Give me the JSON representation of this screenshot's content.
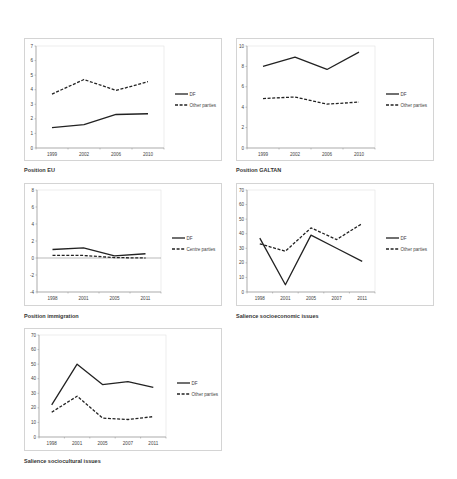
{
  "chart_data": [
    {
      "id": "eu",
      "type": "line",
      "title": "Position EU",
      "categories": [
        "1999",
        "2002",
        "2006",
        "2010"
      ],
      "series": [
        {
          "name": "DF",
          "style": "solid",
          "values": [
            1.4,
            1.6,
            2.3,
            2.35
          ]
        },
        {
          "name": "Other parties",
          "style": "dashed",
          "values": [
            3.7,
            4.7,
            3.95,
            4.55
          ]
        }
      ],
      "ylim": [
        0,
        7
      ],
      "ystep": 1,
      "yticks": [
        "0",
        "1",
        "2",
        "3",
        "4",
        "5",
        "6",
        "7"
      ],
      "xlabel": "",
      "ylabel": "",
      "grid": false,
      "legend_position": "right",
      "box": {
        "x": 24,
        "y": 38,
        "w": 198,
        "h": 123
      },
      "plot": {
        "x": 11,
        "y": 7,
        "w": 128,
        "h": 102
      }
    },
    {
      "id": "galtan",
      "type": "line",
      "title": "Position GALTAN",
      "categories": [
        "1999",
        "2002",
        "2006",
        "2010"
      ],
      "series": [
        {
          "name": "DF",
          "style": "solid",
          "values": [
            8.0,
            8.9,
            7.7,
            9.4
          ]
        },
        {
          "name": "Other parties",
          "style": "dashed",
          "values": [
            4.85,
            5.0,
            4.3,
            4.5
          ]
        }
      ],
      "ylim": [
        0,
        10
      ],
      "ystep": 2,
      "yticks": [
        "0",
        "2",
        "4",
        "6",
        "8",
        "10"
      ],
      "xlabel": "",
      "ylabel": "",
      "grid": false,
      "legend_position": "right",
      "box": {
        "x": 236,
        "y": 38,
        "w": 198,
        "h": 123
      },
      "plot": {
        "x": 10,
        "y": 7,
        "w": 128,
        "h": 102
      }
    },
    {
      "id": "immigration",
      "type": "line",
      "title": "Position immigration",
      "categories": [
        "1998",
        "2001",
        "2005",
        "2011"
      ],
      "series": [
        {
          "name": "DF",
          "style": "solid",
          "values": [
            1.0,
            1.2,
            0.25,
            0.5
          ]
        },
        {
          "name": "Centre parties",
          "style": "dashed",
          "values": [
            0.3,
            0.3,
            0.05,
            0.0
          ]
        }
      ],
      "ylim": [
        -4,
        8
      ],
      "ystep": 2,
      "yticks": [
        "-4",
        "-2",
        "0",
        "2",
        "4",
        "6",
        "8"
      ],
      "zero_line": true,
      "xlabel": "",
      "ylabel": "",
      "grid": false,
      "legend_position": "right",
      "box": {
        "x": 24,
        "y": 183,
        "w": 198,
        "h": 123
      },
      "plot": {
        "x": 12,
        "y": 6,
        "w": 124,
        "h": 102
      }
    },
    {
      "id": "socioeconomic",
      "type": "line",
      "title": "Salience socioeconomic issues",
      "categories": [
        "1998",
        "2001",
        "2005",
        "2007",
        "2011"
      ],
      "series": [
        {
          "name": "DF",
          "style": "solid",
          "values": [
            37,
            5,
            39,
            30,
            21
          ]
        },
        {
          "name": "Other parties",
          "style": "dashed",
          "values": [
            33,
            28,
            44,
            36,
            47
          ]
        }
      ],
      "ylim": [
        0,
        70
      ],
      "ystep": 10,
      "yticks": [
        "0",
        "10",
        "20",
        "30",
        "40",
        "50",
        "60",
        "70"
      ],
      "xlabel": "",
      "ylabel": "",
      "grid": false,
      "legend_position": "right",
      "box": {
        "x": 236,
        "y": 183,
        "w": 198,
        "h": 123
      },
      "plot": {
        "x": 10,
        "y": 6,
        "w": 128,
        "h": 102
      }
    },
    {
      "id": "sociocultural",
      "type": "line",
      "title": "Salience sociocultural issues",
      "categories": [
        "1998",
        "2001",
        "2005",
        "2007",
        "2011"
      ],
      "series": [
        {
          "name": "DF",
          "style": "solid",
          "values": [
            22,
            50,
            36,
            38,
            34
          ]
        },
        {
          "name": "Other parties",
          "style": "dashed",
          "values": [
            17,
            28,
            13,
            12,
            14
          ]
        }
      ],
      "ylim": [
        0,
        70
      ],
      "ystep": 10,
      "yticks": [
        "0",
        "10",
        "20",
        "30",
        "40",
        "50",
        "60",
        "70"
      ],
      "xlabel": "",
      "ylabel": "",
      "grid": false,
      "legend_position": "right",
      "box": {
        "x": 24,
        "y": 328,
        "w": 198,
        "h": 123
      },
      "plot": {
        "x": 14,
        "y": 6,
        "w": 127,
        "h": 102
      }
    }
  ],
  "captions": {
    "eu": "Position EU",
    "galtan": "Position GALTAN",
    "immigration": "Position immigration",
    "socioeconomic": "Salience socioeconomic issues",
    "sociocultural": "Salience sociocultural issues"
  },
  "colors": {
    "line": "#222222",
    "axis": "#8c8c8c",
    "border": "#d4d4d4",
    "text": "#444444"
  }
}
